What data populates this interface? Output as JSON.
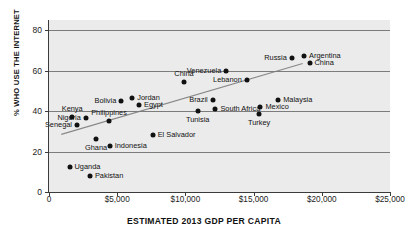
{
  "chart_data": {
    "type": "scatter",
    "title": "",
    "xlabel": "ESTIMATED 2013 GDP PER CAPITA",
    "ylabel": "% WHO USE THE INTERNET",
    "xlim": [
      0,
      25000
    ],
    "ylim": [
      0,
      85
    ],
    "grid": true,
    "legend": "none",
    "xticks": [
      "0",
      "$5,000",
      "$10,000",
      "$15,000",
      "$20,000",
      "$25,000"
    ],
    "xtick_values": [
      0,
      5000,
      10000,
      15000,
      20000,
      25000
    ],
    "yticks": [
      "0",
      "20",
      "40",
      "60",
      "80"
    ],
    "ytick_values": [
      0,
      20,
      40,
      60,
      80
    ],
    "trendline": {
      "x0": 900,
      "y0": 28.5,
      "x1": 18600,
      "y1": 63.5,
      "color": "#888888"
    },
    "points": [
      {
        "name": "Kenya",
        "x": 1700,
        "y": 37,
        "label_pos": "above"
      },
      {
        "name": "Senegal",
        "x": 2050,
        "y": 33,
        "label_pos": "left"
      },
      {
        "name": "Nigeria",
        "x": 2700,
        "y": 36.5,
        "label_pos": "left"
      },
      {
        "name": "Ghana",
        "x": 3450,
        "y": 26,
        "label_pos": "below"
      },
      {
        "name": "Uganda",
        "x": 1500,
        "y": 12.5,
        "label_pos": "right"
      },
      {
        "name": "Pakistan",
        "x": 3000,
        "y": 8,
        "label_pos": "right"
      },
      {
        "name": "Indonesia",
        "x": 4450,
        "y": 23,
        "label_pos": "right"
      },
      {
        "name": "Philippines",
        "x": 4400,
        "y": 35,
        "label_pos": "above"
      },
      {
        "name": "Bolivia",
        "x": 5300,
        "y": 45,
        "label_pos": "left"
      },
      {
        "name": "Jordan",
        "x": 6100,
        "y": 46.5,
        "label_pos": "right"
      },
      {
        "name": "Egypt",
        "x": 6600,
        "y": 43,
        "label_pos": "right"
      },
      {
        "name": "El Salvador",
        "x": 7600,
        "y": 28,
        "label_pos": "right"
      },
      {
        "name": "China",
        "x": 9900,
        "y": 54.5,
        "label_pos": "above"
      },
      {
        "name": "Tunisia",
        "x": 10900,
        "y": 40,
        "label_pos": "below"
      },
      {
        "name": "Brazil",
        "x": 12000,
        "y": 45.5,
        "label_pos": "left"
      },
      {
        "name": "South Africa",
        "x": 12200,
        "y": 41,
        "label_pos": "right"
      },
      {
        "name": "Venezuela",
        "x": 13000,
        "y": 60,
        "label_pos": "left"
      },
      {
        "name": "Lebanon",
        "x": 14500,
        "y": 55.5,
        "label_pos": "left"
      },
      {
        "name": "Mexico",
        "x": 15500,
        "y": 42,
        "label_pos": "right"
      },
      {
        "name": "Turkey",
        "x": 15400,
        "y": 38.5,
        "label_pos": "below"
      },
      {
        "name": "Malaysia",
        "x": 16800,
        "y": 45.5,
        "label_pos": "right"
      },
      {
        "name": "Russia",
        "x": 17800,
        "y": 66,
        "label_pos": "left"
      },
      {
        "name": "Argentina",
        "x": 18700,
        "y": 67,
        "label_pos": "right"
      },
      {
        "name": "China ",
        "x": 19100,
        "y": 64,
        "label_pos": "right",
        "display": "China"
      }
    ]
  }
}
